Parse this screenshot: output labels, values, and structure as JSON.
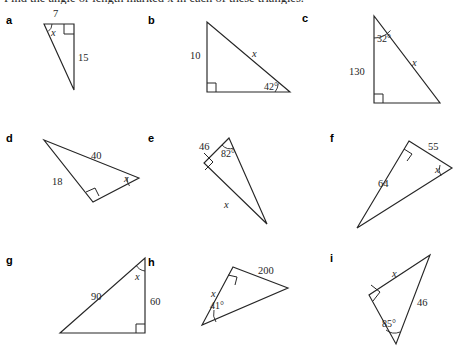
{
  "worksheet": {
    "heading": "Find the angle or length marked x in each of these triangles.",
    "unknown_symbol": "x",
    "ink_color": "#262626",
    "page_background": "#ffffff"
  },
  "items": [
    {
      "letter": "a",
      "letter_pos": [
        6,
        14
      ],
      "triangle": {
        "points": "44,24 74,24 74,90",
        "right_angle_at": "top-right",
        "right_angle_marker": "64,24 64,34 74,34",
        "angle_arc": {
          "at": "top-left",
          "path": "M 52,24 A 9,9 0 0 1 48.2,31.4"
        }
      },
      "labels": [
        {
          "text": "7",
          "value": "7",
          "kind": "length",
          "pos": [
            53,
            8
          ]
        },
        {
          "text": "15",
          "value": "15",
          "kind": "length",
          "pos": [
            78,
            52
          ]
        },
        {
          "text": "x",
          "value": "x",
          "kind": "unknown-angle",
          "pos": [
            51,
            27
          ]
        }
      ]
    },
    {
      "letter": "b",
      "letter_pos": [
        148,
        14
      ],
      "triangle": {
        "points": "207,22 207,92 290,92",
        "right_angle_at": "bottom-left",
        "right_angle_marker": "207,83 216,83 216,92",
        "angle_arc": {
          "at": "bottom-right",
          "path": "M 275,92 A 15,15 0 0 0 278.3,83.5"
        }
      },
      "labels": [
        {
          "text": "10",
          "value": "10",
          "kind": "length",
          "pos": [
            190,
            50
          ]
        },
        {
          "text": "x",
          "value": "x",
          "kind": "unknown-length",
          "pos": [
            252,
            48
          ]
        },
        {
          "text": "42°",
          "value": "42",
          "kind": "angle",
          "pos": [
            264,
            81
          ]
        }
      ]
    },
    {
      "letter": "c",
      "letter_pos": [
        302,
        12
      ],
      "triangle": {
        "points": "374,16 374,103 440,103",
        "right_angle_at": "bottom-left",
        "right_angle_marker": "374,94 383,94 383,103",
        "angle_arc": {
          "at": "apex",
          "path": "M 374,38 A 22,22 0 0 0 390.5,30.5"
        }
      },
      "labels": [
        {
          "text": "32°",
          "value": "32",
          "kind": "angle",
          "pos": [
            377,
            33
          ]
        },
        {
          "text": "130",
          "value": "130",
          "kind": "length",
          "pos": [
            349,
            66
          ]
        },
        {
          "text": "x",
          "value": "x",
          "kind": "unknown-length",
          "pos": [
            412,
            57
          ]
        }
      ]
    },
    {
      "letter": "d",
      "letter_pos": [
        6,
        132
      ],
      "triangle": {
        "points": "44,140 139,178 93,202",
        "right_angle_at": "bottom",
        "right_angle_marker": "86,192 95,188 99,196",
        "angle_arc": {
          "at": "right",
          "path": "M 127,177 A 13,13 0 0 0 129.5,186"
        }
      },
      "labels": [
        {
          "text": "40",
          "value": "40",
          "kind": "length",
          "pos": [
            91,
            150
          ]
        },
        {
          "text": "18",
          "value": "18",
          "kind": "length",
          "pos": [
            52,
            176
          ]
        },
        {
          "text": "x",
          "value": "x",
          "kind": "unknown-angle",
          "pos": [
            124,
            173
          ]
        }
      ]
    },
    {
      "letter": "e",
      "letter_pos": [
        148,
        132
      ],
      "triangle": {
        "points": "229,138 204,163 267,224",
        "right_angle_at": "left",
        "right_angle_marker": "204,153 213,162 205,170",
        "angle_arc": {
          "at": "top",
          "path": "M 222,145 A 11,11 0 0 0 234,148"
        }
      },
      "labels": [
        {
          "text": "46",
          "value": "46",
          "kind": "length",
          "pos": [
            199,
            141
          ]
        },
        {
          "text": "82°",
          "value": "82",
          "kind": "angle",
          "pos": [
            221,
            148
          ]
        },
        {
          "text": "x",
          "value": "x",
          "kind": "unknown-length",
          "pos": [
            224,
            199
          ]
        }
      ]
    },
    {
      "letter": "f",
      "letter_pos": [
        330,
        132
      ],
      "triangle": {
        "points": "409,141 452,168 357,228",
        "right_angle_at": "top",
        "right_angle_marker": "404,149 412,154 407,161",
        "angle_arc": {
          "at": "right",
          "path": "M 440,165 A 12,12 0 0 0 441,176"
        }
      },
      "labels": [
        {
          "text": "55",
          "value": "55",
          "kind": "length",
          "pos": [
            428,
            141
          ]
        },
        {
          "text": "64",
          "value": "64",
          "kind": "length",
          "pos": [
            378,
            178
          ]
        },
        {
          "text": "x",
          "value": "x",
          "kind": "unknown-angle",
          "pos": [
            435,
            164
          ]
        }
      ]
    },
    {
      "letter": "g",
      "letter_pos": [
        6,
        254
      ],
      "triangle": {
        "points": "145,258 145,333 60,333",
        "right_angle_at": "bottom-right",
        "right_angle_marker": "136,333 136,324 145,324",
        "angle_arc": {
          "at": "top",
          "path": "M 136,265 A 12,12 0 0 0 145,271"
        }
      },
      "labels": [
        {
          "text": "90",
          "value": "90",
          "kind": "length",
          "pos": [
            91,
            291
          ]
        },
        {
          "text": "60",
          "value": "60",
          "kind": "length",
          "pos": [
            150,
            296
          ]
        },
        {
          "text": "x",
          "value": "x",
          "kind": "unknown-angle",
          "pos": [
            135,
            271
          ]
        }
      ]
    },
    {
      "letter": "h",
      "letter_pos": [
        148,
        256
      ],
      "triangle": {
        "points": "233,267 288,288 202,325",
        "right_angle_at": "top",
        "right_angle_marker": "228,275 237,277 235,285",
        "angle_arc": {
          "at": "bottom-left",
          "path": "M 214,310 A 15,15 0 0 0 216,322"
        }
      },
      "labels": [
        {
          "text": "200",
          "value": "200",
          "kind": "length",
          "pos": [
            258,
            265
          ]
        },
        {
          "text": "x",
          "value": "x",
          "kind": "unknown-length",
          "pos": [
            211,
            288
          ]
        },
        {
          "text": "41°",
          "value": "41",
          "kind": "angle",
          "pos": [
            210,
            300
          ]
        }
      ]
    },
    {
      "letter": "i",
      "letter_pos": [
        330,
        252
      ],
      "triangle": {
        "points": "430,255 369,295 396,344",
        "right_angle_at": "left",
        "right_angle_marker": "371,285 380,292 373,301",
        "angle_arc": {
          "at": "bottom",
          "path": "M 386,330 A 14,14 0 0 0 400,332"
        }
      },
      "labels": [
        {
          "text": "x",
          "value": "x",
          "kind": "unknown-length",
          "pos": [
            392,
            268
          ]
        },
        {
          "text": "46",
          "value": "46",
          "kind": "length",
          "pos": [
            417,
            297
          ]
        },
        {
          "text": "85°",
          "value": "85",
          "kind": "angle",
          "pos": [
            382,
            318
          ]
        }
      ]
    }
  ]
}
